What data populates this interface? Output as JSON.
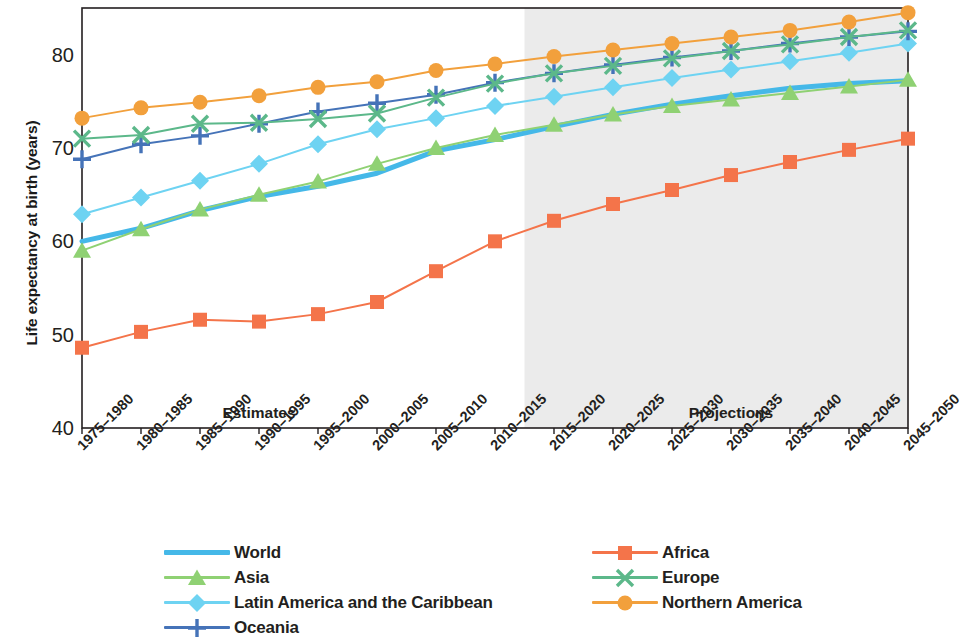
{
  "chart_data": {
    "type": "line",
    "title": "",
    "xlabel": "",
    "ylabel": "Life expectancy at birth (years)",
    "ylim": [
      40,
      85
    ],
    "yticks": [
      40,
      50,
      60,
      70,
      80
    ],
    "grid": false,
    "legend_position": "bottom",
    "categories": [
      "1975–1980",
      "1980–1985",
      "1985–1990",
      "1990–1995",
      "1995–2000",
      "2000–2005",
      "2005–2010",
      "2010–2015",
      "2015–2020",
      "2020–2025",
      "2025–2030",
      "2030–2035",
      "2035–2040",
      "2040–2045",
      "2045–2050"
    ],
    "annotations": [
      {
        "text": "Estimates",
        "at_category": "1990–1995",
        "y": 41.5
      },
      {
        "text": "Projections",
        "at_category": "2030–2035",
        "y": 41.5
      }
    ],
    "shaded_region": {
      "label": "Projections",
      "from_category": "2010–2015",
      "to_category": "2045–2050",
      "color": "#ebebeb"
    },
    "series": [
      {
        "name": "World",
        "color": "#45b8e8",
        "marker": "none",
        "linewidth": 5,
        "values": [
          60.0,
          61.4,
          63.3,
          64.8,
          65.9,
          67.3,
          69.7,
          70.9,
          72.3,
          73.6,
          74.7,
          75.6,
          76.4,
          76.9,
          77.2
        ]
      },
      {
        "name": "Asia",
        "color": "#8fd173",
        "marker": "triangle",
        "linewidth": 2,
        "values": [
          59.0,
          61.3,
          63.4,
          65.0,
          66.4,
          68.3,
          70.0,
          71.4,
          72.5,
          73.6,
          74.5,
          75.2,
          75.9,
          76.6,
          77.3
        ]
      },
      {
        "name": "Latin America and the Caribbean",
        "color": "#6ed3f2",
        "marker": "diamond",
        "linewidth": 2,
        "values": [
          62.9,
          64.7,
          66.5,
          68.3,
          70.4,
          72.0,
          73.2,
          74.5,
          75.5,
          76.5,
          77.5,
          78.4,
          79.3,
          80.2,
          81.2
        ]
      },
      {
        "name": "Oceania",
        "color": "#4573b8",
        "marker": "plus",
        "linewidth": 2,
        "values": [
          68.8,
          70.4,
          71.3,
          72.6,
          73.9,
          74.8,
          75.7,
          77.0,
          78.0,
          78.9,
          79.7,
          80.4,
          81.2,
          81.9,
          82.5
        ]
      },
      {
        "name": "Africa",
        "color": "#f4744a",
        "marker": "square",
        "linewidth": 2,
        "values": [
          48.6,
          50.3,
          51.6,
          51.4,
          52.2,
          53.5,
          56.8,
          60.0,
          62.2,
          64.0,
          65.5,
          67.1,
          68.5,
          69.8,
          71.0
        ]
      },
      {
        "name": "Europe",
        "color": "#5cb88a",
        "marker": "cross",
        "linewidth": 2,
        "values": [
          71.0,
          71.4,
          72.6,
          72.7,
          73.1,
          73.7,
          75.4,
          76.9,
          78.0,
          78.8,
          79.6,
          80.4,
          81.1,
          81.9,
          82.6
        ]
      },
      {
        "name": "Northern America",
        "color": "#f2a03c",
        "marker": "circle",
        "linewidth": 2,
        "values": [
          73.2,
          74.3,
          74.9,
          75.6,
          76.5,
          77.1,
          78.3,
          79.0,
          79.8,
          80.5,
          81.2,
          81.9,
          82.6,
          83.5,
          84.5
        ]
      }
    ],
    "legend_columns": [
      [
        "World",
        "Asia",
        "Latin America and the Caribbean",
        "Oceania"
      ],
      [
        "Africa",
        "Europe",
        "Northern America"
      ]
    ]
  }
}
